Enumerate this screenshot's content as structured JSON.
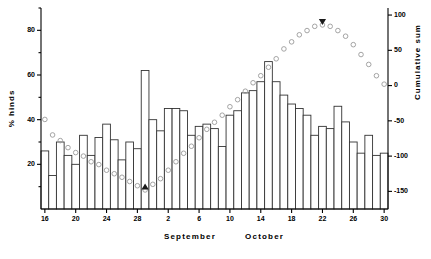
{
  "chart_data": {
    "type": "bar",
    "title": "",
    "subtitle": "",
    "xlabel": "",
    "ylabel": "% hinds",
    "y2label": "Cumulative sum",
    "grid": false,
    "legend": "none",
    "ylim": [
      0,
      90
    ],
    "y2lim": [
      -175,
      110
    ],
    "y_ticks": [
      20,
      40,
      60,
      80
    ],
    "y2_ticks": [
      100,
      50,
      0,
      -50,
      -100,
      -150
    ],
    "x_tick_labels": [
      "16",
      "20",
      "24",
      "28",
      "2",
      "6",
      "10",
      "14",
      "18",
      "22",
      "26",
      "30"
    ],
    "x_tick_days": [
      16,
      20,
      24,
      28,
      2,
      6,
      10,
      14,
      18,
      22,
      26,
      30
    ],
    "month_labels": [
      "September",
      "October"
    ],
    "categories": [
      "Sep 16",
      "Sep 17",
      "Sep 18",
      "Sep 19",
      "Sep 20",
      "Sep 21",
      "Sep 22",
      "Sep 23",
      "Sep 24",
      "Sep 25",
      "Sep 26",
      "Sep 27",
      "Sep 28",
      "Sep 29",
      "Sep 30",
      "Oct 1",
      "Oct 2",
      "Oct 3",
      "Oct 4",
      "Oct 5",
      "Oct 6",
      "Oct 7",
      "Oct 8",
      "Oct 9",
      "Oct 10",
      "Oct 11",
      "Oct 12",
      "Oct 13",
      "Oct 14",
      "Oct 15",
      "Oct 16",
      "Oct 17",
      "Oct 18",
      "Oct 19",
      "Oct 20",
      "Oct 21",
      "Oct 22",
      "Oct 23",
      "Oct 24",
      "Oct 25",
      "Oct 26",
      "Oct 27",
      "Oct 28",
      "Oct 29",
      "Oct 30"
    ],
    "series": [
      {
        "name": "% hinds",
        "type": "bar",
        "axis": "left",
        "values": [
          26,
          15,
          30,
          24,
          20,
          33,
          24,
          32,
          38,
          31,
          22,
          30,
          27,
          62,
          40,
          35,
          45,
          45,
          44,
          33,
          37,
          38,
          36,
          28,
          42,
          44,
          52,
          53,
          57,
          66,
          57,
          51,
          47,
          45,
          42,
          33,
          37,
          36,
          46,
          39,
          30,
          25,
          33,
          24,
          25
        ]
      },
      {
        "name": "Cumulative sum",
        "type": "scatter",
        "axis": "right",
        "marker": "open-circle",
        "values": [
          -48,
          -70,
          -78,
          -88,
          -95,
          -100,
          -108,
          -112,
          -120,
          -125,
          -130,
          -136,
          -142,
          -148,
          -140,
          -132,
          -120,
          -108,
          -96,
          -86,
          -74,
          -62,
          -52,
          -42,
          -30,
          -20,
          -8,
          4,
          14,
          26,
          38,
          52,
          62,
          72,
          78,
          84,
          86,
          84,
          78,
          70,
          58,
          44,
          30,
          14,
          2
        ]
      }
    ],
    "annotations": [
      {
        "name": "up-triangle-marker",
        "symbol": "triangle-up",
        "category": "Sep 29",
        "axis": "right",
        "value": -148,
        "note": ""
      },
      {
        "name": "down-triangle-marker",
        "symbol": "triangle-down",
        "category": "Oct 22",
        "axis": "right",
        "value": 86,
        "note": ""
      }
    ],
    "colors": {
      "bar_fill": "#ffffff",
      "bar_stroke": "#333333",
      "marker_stroke": "#9a9a9a",
      "triangle": "#1a1a1a",
      "axis": "#000000",
      "background": "#ffffff"
    }
  }
}
